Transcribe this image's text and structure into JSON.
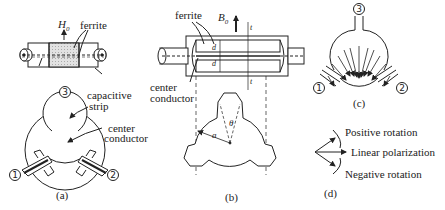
{
  "figure": {
    "panels": {
      "a": {
        "caption": "(a)",
        "field_label": "H",
        "field_sub": "0",
        "ferrite_label": "ferrite",
        "capacitive_strip_label_1": "capacitive",
        "capacitive_strip_label_2": "strip",
        "center_conductor_label_1": "center",
        "center_conductor_label_2": "conductor",
        "ports": [
          "1",
          "2",
          "3"
        ]
      },
      "b": {
        "caption": "(b)",
        "ferrite_label": "ferrite",
        "field_label": "B",
        "field_sub": "0",
        "center_conductor_label_1": "center",
        "center_conductor_label_2": "conductor",
        "dim_t": "t",
        "dim_d": "d",
        "radius_label": "a",
        "angle_label": "θ"
      },
      "c": {
        "caption": "(c)",
        "ports": [
          "1",
          "2",
          "3"
        ]
      },
      "d": {
        "caption": "(d)",
        "positive_label": "Positive rotation",
        "linear_label": "Linear polarization",
        "negative_label": "Negative rotation"
      }
    },
    "colors": {
      "line": "#222222",
      "ferrite_fill": "#d9d9d9",
      "background": "#ffffff"
    }
  }
}
